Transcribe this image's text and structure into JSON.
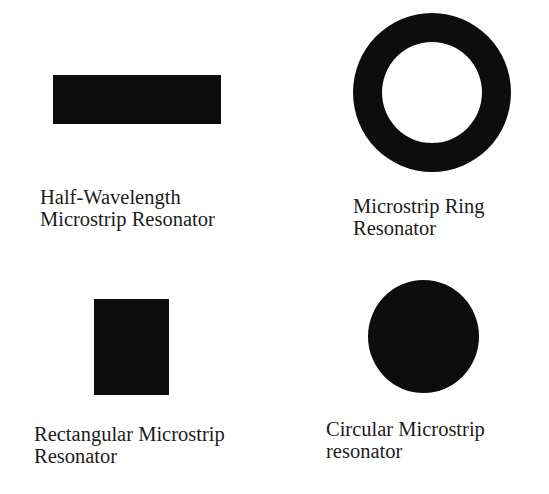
{
  "figure": {
    "items": [
      {
        "shape": "rectangle-horizontal",
        "caption_lines": [
          "Half-Wavelength",
          "Microstrip Resonator"
        ]
      },
      {
        "shape": "ring",
        "caption_lines": [
          "Microstrip Ring",
          "Resonator"
        ]
      },
      {
        "shape": "rectangle-patch",
        "caption_lines": [
          "Rectangular Microstrip",
          "Resonator"
        ]
      },
      {
        "shape": "circle-disc",
        "caption_lines": [
          "Circular Microstrip",
          "resonator"
        ]
      }
    ],
    "colors": {
      "shape_fill": "#0d0d0d",
      "background": "#ffffff",
      "text": "#1c1c1c"
    }
  }
}
